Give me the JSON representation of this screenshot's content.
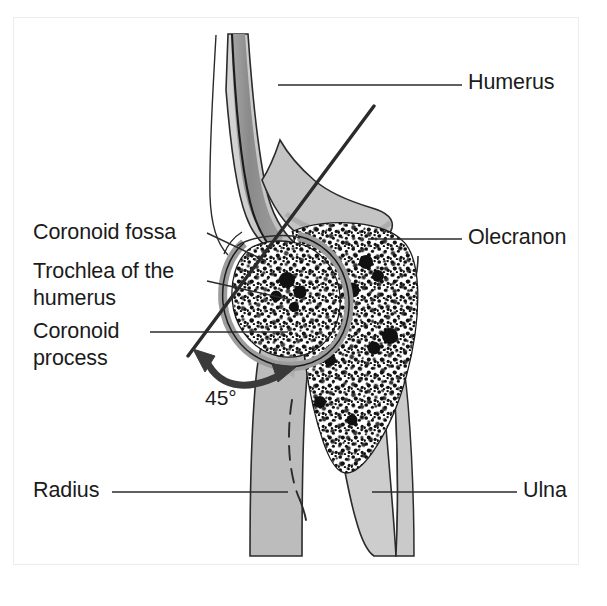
{
  "figure": {
    "domain": "anatomical-illustration",
    "frame": {
      "x": 13,
      "y": 17,
      "width": 566,
      "height": 548,
      "border_color": "#ececec"
    },
    "background_color": "#ffffff"
  },
  "palette": {
    "outline": "#1b1b1b",
    "bone_light_gray": "#c9c9c9",
    "bone_mid_gray": "#b4b4b4",
    "medullary_dark_gray": "#8d8d8d",
    "cartilage_gray": "#a8a8a8",
    "spongy_white": "#ffffff",
    "trabecular_dot": "#111111",
    "leader_line": "#2b2b2b",
    "arrow": "#3a3a3a",
    "text": "#1b1b1b"
  },
  "labels": [
    {
      "id": "humerus",
      "text": "Humerus",
      "side": "right",
      "x": 468,
      "y": 69,
      "leader": {
        "x1": 278,
        "y1": 85,
        "x2": 462,
        "y2": 85
      }
    },
    {
      "id": "olecranon",
      "text": "Olecranon",
      "side": "right",
      "x": 468,
      "y": 224,
      "leader": {
        "x1": 368,
        "y1": 239,
        "x2": 462,
        "y2": 239
      }
    },
    {
      "id": "ulna",
      "text": "Ulna",
      "side": "right",
      "x": 523,
      "y": 477,
      "leader": {
        "x1": 372,
        "y1": 492,
        "x2": 517,
        "y2": 492
      }
    },
    {
      "id": "radius",
      "text": "Radius",
      "side": "left",
      "x": 33,
      "y": 477,
      "leader": {
        "x1": 112,
        "y1": 492,
        "x2": 288,
        "y2": 492
      }
    },
    {
      "id": "coronoid-fossa",
      "text": "Coronoid fossa",
      "side": "left",
      "x": 33,
      "y": 219,
      "leader": {
        "x1": 207,
        "y1": 233,
        "x2": 266,
        "y2": 261
      }
    },
    {
      "id": "trochlea-of-the-humerus",
      "text": "Trochlea of the\nhumerus",
      "side": "left",
      "x": 33,
      "y": 258,
      "leader": {
        "x1": 207,
        "y1": 281,
        "x2": 292,
        "y2": 300
      }
    },
    {
      "id": "coronoid-process",
      "text": "Coronoid\nprocess",
      "side": "left",
      "x": 33,
      "y": 318,
      "leader": {
        "x1": 150,
        "y1": 332,
        "x2": 288,
        "y2": 332
      }
    }
  ],
  "angle_annotation": {
    "id": "flexion-angle",
    "value": "45°",
    "x": 205,
    "y": 386,
    "arrow": {
      "type": "double-headed-curved",
      "start": {
        "x": 196,
        "y": 352
      },
      "control": {
        "x": 226,
        "y": 396
      },
      "end": {
        "x": 287,
        "y": 374
      },
      "color": "#3a3a3a",
      "stroke_width": 7
    }
  },
  "axis_line": {
    "id": "humerus-long-axis",
    "x1": 374,
    "y1": 106,
    "x2": 188,
    "y2": 356,
    "stroke_width": 3.4,
    "color": "#2b2b2b"
  },
  "structures": [
    {
      "id": "humerus-shaft",
      "name": "humerus shaft",
      "fill": "#c9c9c9"
    },
    {
      "id": "humerus-medullary-cavity",
      "name": "medullary cavity of humerus",
      "fill": "#8d8d8d"
    },
    {
      "id": "humerus-periosteum-outline",
      "name": "periosteum outline of humerus",
      "fill": "none"
    },
    {
      "id": "trochlea",
      "name": "trochlea of the humerus",
      "fill": "#ffffff",
      "texture": "trabecular-stipple"
    },
    {
      "id": "olecranon-body",
      "name": "olecranon of ulna",
      "fill": "#ffffff",
      "texture": "trabecular-stipple"
    },
    {
      "id": "joint-cartilage",
      "name": "articular cartilage",
      "fill": "#a8a8a8"
    },
    {
      "id": "radius-shaft",
      "name": "radius shaft",
      "fill": "#b4b4b4"
    },
    {
      "id": "ulna-shaft",
      "name": "ulna shaft",
      "fill": "#c9c9c9"
    },
    {
      "id": "coronoid-process-body",
      "name": "coronoid process",
      "fill": "#b4b4b4"
    }
  ]
}
